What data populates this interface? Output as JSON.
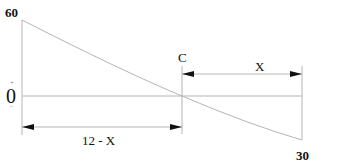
{
  "diagram": {
    "type": "shear-force-diagram",
    "labels": {
      "top_value": "60",
      "bottom_value": "30",
      "zero": "0",
      "plus_sign": "+",
      "minus_sign": "-",
      "point": "C",
      "dim_right": "X",
      "dim_left": "12 - X"
    },
    "colors": {
      "line": "#b5b5b5",
      "arrow": "#111111",
      "text": "#111111"
    },
    "geometry": {
      "left_x": 22,
      "zero_crossing_x": 182,
      "right_x": 302,
      "top_y": 20,
      "baseline_y": 96,
      "bottom_y": 140,
      "dim_top_y": 74,
      "dim_bottom_y": 127
    }
  }
}
